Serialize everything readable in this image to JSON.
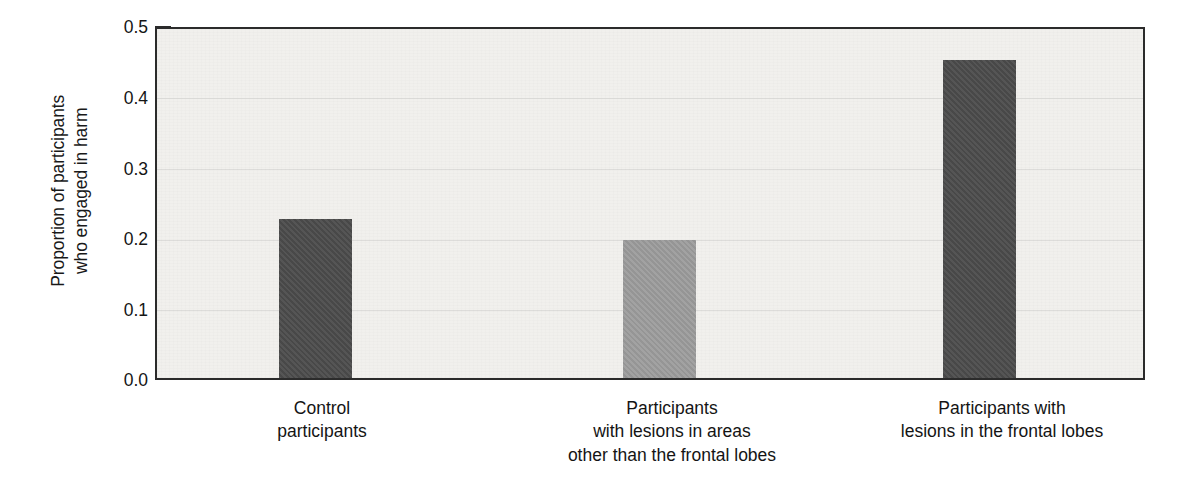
{
  "chart_data": {
    "type": "bar",
    "title": "",
    "xlabel": "",
    "ylabel_line1": "Proportion of participants",
    "ylabel_line2": "who engaged in harm",
    "categories": [
      [
        "Control",
        "participants"
      ],
      [
        "Participants",
        "with lesions in areas",
        "other than the frontal lobes"
      ],
      [
        "Participants with",
        "lesions in the frontal lobes"
      ]
    ],
    "category_labels_flat": [
      "Control participants",
      "Participants with lesions in areas other than the frontal lobes",
      "Participants with lesions in the frontal lobes"
    ],
    "values": [
      0.228,
      0.198,
      0.455
    ],
    "bar_colors": [
      "#4c4c4c",
      "#9d9d9d",
      "#4c4c4c"
    ],
    "ylim": [
      0.0,
      0.5
    ],
    "yticks": [
      0.0,
      0.1,
      0.2,
      0.3,
      0.4,
      0.5
    ],
    "ytick_labels": [
      "0.0",
      "0.1",
      "0.2",
      "0.3",
      "0.4",
      "0.5"
    ],
    "grid": true,
    "legend": "none",
    "plot_background": "#f1f0ed",
    "axis_color": "#2b2b2b"
  }
}
